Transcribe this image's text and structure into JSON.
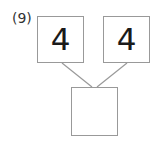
{
  "problem": {
    "label": "(9)",
    "left_value": "4",
    "right_value": "4",
    "result_value": ""
  },
  "colors": {
    "box_border": "#999999",
    "line": "#999999",
    "text": "#1a1a1a"
  }
}
